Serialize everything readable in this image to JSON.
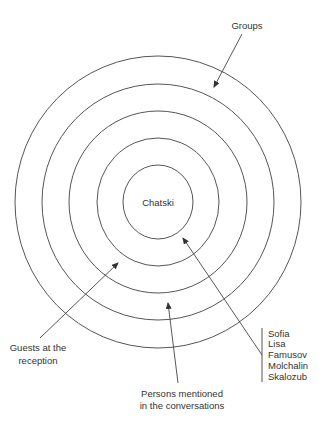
{
  "diagram": {
    "center": {
      "x": 158,
      "y": 202
    },
    "rings": [
      {
        "rx": 35,
        "ry": 37
      },
      {
        "rx": 61,
        "ry": 64
      },
      {
        "rx": 89,
        "ry": 91
      },
      {
        "rx": 116,
        "ry": 118
      },
      {
        "rx": 143,
        "ry": 146
      }
    ],
    "center_label": "Chatski",
    "labels": {
      "groups": "Groups",
      "guests_line1": "Guests at the",
      "guests_line2": "reception",
      "persons_line1": "Persons mentioned",
      "persons_line2": "in the conversations"
    },
    "inner_circle_members": [
      "Sofia",
      "Lisa",
      "Famusov",
      "Molchalin",
      "Skalozub"
    ],
    "colors": {
      "line": "#444444",
      "text": "#333333",
      "background": "#ffffff"
    }
  }
}
